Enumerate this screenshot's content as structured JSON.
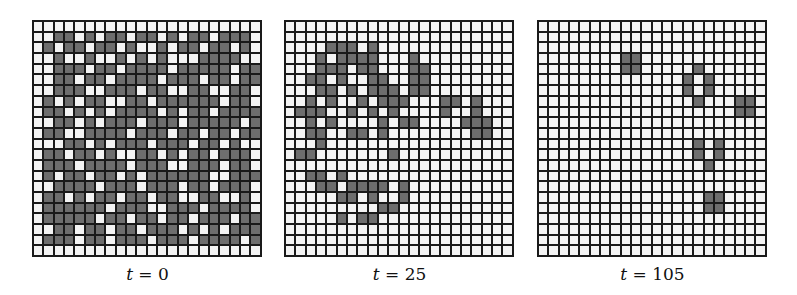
{
  "figure": {
    "grid_size": 22,
    "colors": {
      "alive": "#6e6e6e",
      "dead": "#f4f4f4",
      "lines": "#1a1a1a"
    },
    "panels": [
      {
        "var": "t",
        "eq": " = ",
        "value": "0",
        "left": 32,
        "rows": [
          "0000000000000000000000",
          "0011010110110101101110",
          "0101101101001011011010",
          "0010010010101000111100",
          "0011101101111011111011",
          "0011011011110111011011",
          "0011100111011001100110",
          "0101011001101111110110",
          "0110101011110101101111",
          "0011010111011101111101",
          "0110011110111011011011",
          "0001101011101110110100",
          "0110110100110101101110",
          "0111011110111001110110",
          "0101101101011111100111",
          "0011110111011101101110",
          "0110101101101100110010",
          "0111111011100111011110",
          "0111110110110110111011",
          "0011011011011101010111",
          "0111011011101110111101",
          "0000000000000000000000"
        ]
      },
      {
        "var": "t",
        "eq": " = ",
        "value": "25",
        "left": 284,
        "rows": [
          "0000000000000000000000",
          "0000000000000000000000",
          "0000111010000000000000",
          "0001011110001000000000",
          "0001110110001100000000",
          "0011010011001100000000",
          "0001101011101100000000",
          "0010100101110001101000",
          "0111001010100001001000",
          "0010100001011000011100",
          "0011001101000000001100",
          "0001000000000000000000",
          "0110000000100000000000",
          "0000000000000000000000",
          "0011010000000000000000",
          "0001101111010000000000",
          "0000011010010000000000",
          "0000000001100000000000",
          "0000010110000000000000",
          "0000000000000000000000",
          "0000000000000000000000",
          "0000000000000000000000"
        ]
      },
      {
        "var": "t",
        "eq": " = ",
        "value": "105",
        "left": 537,
        "rows": [
          "0000000000000000000000",
          "0000000000000000000000",
          "0000000000000000000000",
          "0000000011000000000000",
          "0000000011000001000000",
          "0000000000000010100000",
          "0000000000000010100000",
          "0000000000000001000110",
          "0000000000000000000110",
          "0000000000000000000000",
          "0000000000000000000000",
          "0000000000000001010000",
          "0000000000000001010000",
          "0000000000000000100000",
          "0000000000000000000000",
          "0000000000000000000000",
          "0000000000000000110000",
          "0000000000000000110000",
          "0000000000000000000000",
          "0000000000000000000000",
          "0000000000000000000000",
          "0000000000000000000000"
        ]
      }
    ]
  }
}
